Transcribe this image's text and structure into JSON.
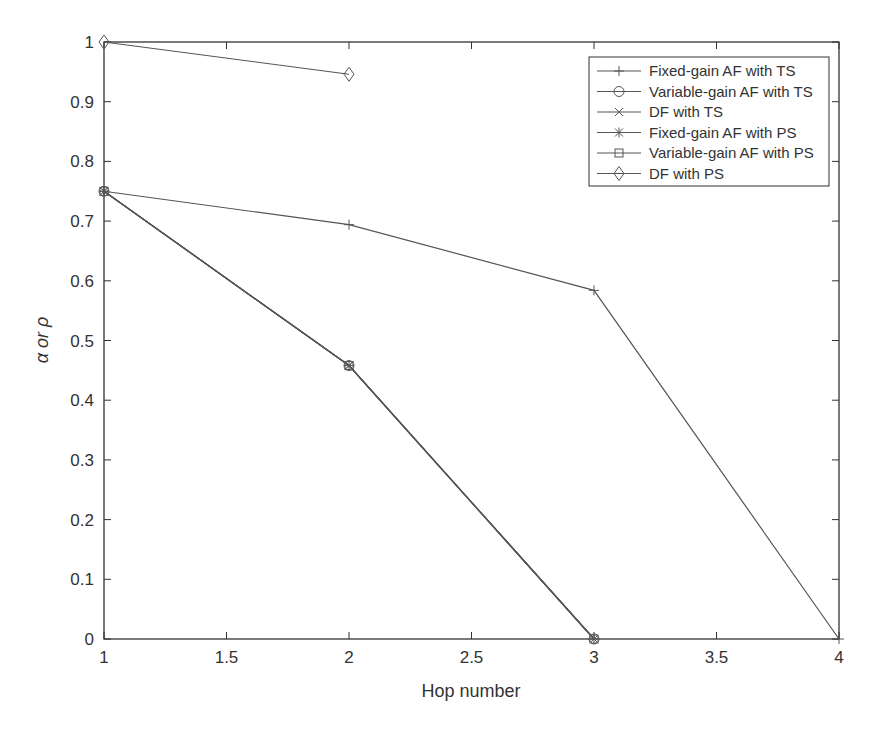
{
  "chart_data": {
    "type": "line",
    "title": "",
    "xlabel": "Hop number",
    "ylabel": "α or ρ",
    "xlim": [
      1,
      4
    ],
    "ylim": [
      0,
      1
    ],
    "xticks": [
      "1",
      "1.5",
      "2",
      "2.5",
      "3",
      "3.5",
      "4"
    ],
    "yticks": [
      "0",
      "0.1",
      "0.2",
      "0.3",
      "0.4",
      "0.5",
      "0.6",
      "0.7",
      "0.8",
      "0.9",
      "1"
    ],
    "grid": false,
    "legend_position": "upper right",
    "series": [
      {
        "name": "Fixed-gain AF with TS",
        "marker": "plus",
        "x": [
          1,
          2,
          3,
          4
        ],
        "values": [
          0.75,
          0.694,
          0.584,
          0
        ]
      },
      {
        "name": "Variable-gain AF with TS",
        "marker": "circle",
        "x": [
          1,
          2,
          3
        ],
        "values": [
          0.75,
          0.458,
          0
        ]
      },
      {
        "name": "DF with TS",
        "marker": "x",
        "x": [
          1,
          2,
          3
        ],
        "values": [
          0.75,
          0.458,
          0
        ]
      },
      {
        "name": "Fixed-gain AF with PS",
        "marker": "star",
        "x": [
          1,
          2,
          3
        ],
        "values": [
          0.75,
          0.458,
          0
        ]
      },
      {
        "name": "Variable-gain AF with PS",
        "marker": "square",
        "x": [
          1,
          2,
          3
        ],
        "values": [
          0.75,
          0.458,
          0
        ]
      },
      {
        "name": "DF with PS",
        "marker": "diamond",
        "x": [
          1,
          2
        ],
        "values": [
          1.0,
          0.946
        ]
      }
    ]
  },
  "colors": {
    "line": "#555555",
    "axis": "#333333"
  }
}
